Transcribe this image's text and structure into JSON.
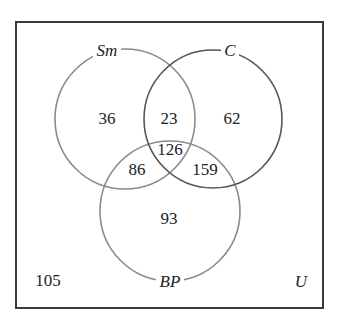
{
  "diagram": {
    "type": "venn-3",
    "universe": {
      "label": "U",
      "outside_count": "105",
      "box": {
        "x": 16,
        "y": 22,
        "width": 307,
        "height": 286
      },
      "border_color": "#3a3a3a"
    },
    "sets": [
      {
        "id": "Sm",
        "label": "Sm",
        "cx": 125,
        "cy": 119,
        "r": 70,
        "stroke": "#8a8a8a",
        "label_x": 107,
        "label_y": 52
      },
      {
        "id": "C",
        "label": "C",
        "cx": 213,
        "cy": 119,
        "r": 69,
        "stroke": "#555555",
        "label_x": 230,
        "label_y": 52
      },
      {
        "id": "BP",
        "label": "BP",
        "cx": 170,
        "cy": 211,
        "r": 70,
        "stroke": "#8a8a8a",
        "label_x": 170,
        "label_y": 283
      }
    ],
    "regions": {
      "sm_only": {
        "value": "36",
        "x": 107,
        "y": 120
      },
      "sm_c_only": {
        "value": "23",
        "x": 169,
        "y": 120
      },
      "c_only": {
        "value": "62",
        "x": 232,
        "y": 120
      },
      "sm_c_bp": {
        "value": "126",
        "x": 170,
        "y": 151
      },
      "sm_bp_only": {
        "value": "86",
        "x": 137,
        "y": 171
      },
      "c_bp_only": {
        "value": "159",
        "x": 205,
        "y": 171
      },
      "bp_only": {
        "value": "93",
        "x": 169,
        "y": 220
      },
      "none": {
        "value": "105",
        "x": 48,
        "y": 282
      }
    },
    "universe_label_pos": {
      "x": 301,
      "y": 283
    }
  }
}
